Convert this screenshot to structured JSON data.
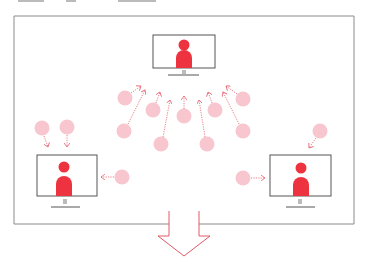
{
  "diagram": {
    "colors": {
      "frame": "#8a8a8a",
      "monitor": "#555555",
      "person": "#ee3340",
      "participant": "#f7c6ce",
      "arrow": "#e8707c",
      "big_arrow": "#e05a66"
    },
    "monitors": [
      {
        "id": "top",
        "x": 153,
        "y": 35,
        "w": 62,
        "h": 33
      },
      {
        "id": "left",
        "x": 37,
        "y": 155,
        "w": 60,
        "h": 41
      },
      {
        "id": "right",
        "x": 270,
        "y": 155,
        "w": 61,
        "h": 41
      }
    ],
    "participants": [
      {
        "cx": 42,
        "cy": 128
      },
      {
        "cx": 67,
        "cy": 127
      },
      {
        "cx": 122,
        "cy": 177
      },
      {
        "cx": 125,
        "cy": 98
      },
      {
        "cx": 124,
        "cy": 131
      },
      {
        "cx": 153,
        "cy": 110
      },
      {
        "cx": 161,
        "cy": 144
      },
      {
        "cx": 184,
        "cy": 116
      },
      {
        "cx": 207,
        "cy": 144
      },
      {
        "cx": 215,
        "cy": 110
      },
      {
        "cx": 243,
        "cy": 99
      },
      {
        "cx": 243,
        "cy": 131
      },
      {
        "cx": 243,
        "cy": 178
      },
      {
        "cx": 320,
        "cy": 131
      }
    ],
    "output_arrow": {
      "direction": "down",
      "label": ""
    }
  }
}
